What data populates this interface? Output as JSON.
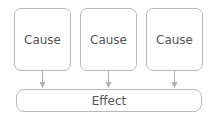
{
  "diagram": {
    "causes": [
      {
        "label": "Cause"
      },
      {
        "label": "Cause"
      },
      {
        "label": "Cause"
      }
    ],
    "effect": {
      "label": "Effect"
    },
    "colors": {
      "border": "#b8b8b8",
      "text": "#555555",
      "arrow": "#b0b0b0"
    }
  }
}
